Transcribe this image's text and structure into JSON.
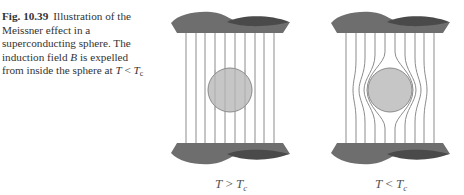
{
  "caption": {
    "figure_label": "Fig. 10.39",
    "text_part1": "Illustration of the Meissner effect in a superconducting sphere. The induction field ",
    "field_symbol": "B",
    "text_part2": " is expelled from inside the sphere at ",
    "condition_T": "T",
    "condition_op": " < ",
    "condition_Tc": "T",
    "condition_sub": "c"
  },
  "panels": [
    {
      "id": "left",
      "label_T": "T",
      "label_op": " > ",
      "label_Tc": "T",
      "label_sub": "c",
      "state": "normal"
    },
    {
      "id": "right",
      "label_T": "T",
      "label_op": " < ",
      "label_Tc": "T",
      "label_sub": "c",
      "state": "superconducting"
    }
  ],
  "colors": {
    "plate": "#6e6e6e",
    "plate_dark": "#4a4a4a",
    "field_line": "#8c8c8c",
    "sphere_fill": "#c6c6c6",
    "sphere_stroke": "#8a8a8a"
  }
}
